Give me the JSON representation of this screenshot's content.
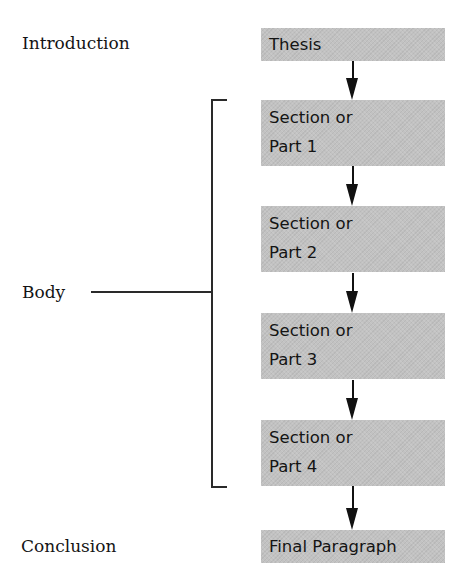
{
  "diagram": {
    "type": "flowchart",
    "left_labels": {
      "introduction": "Introduction",
      "body": "Body",
      "conclusion": "Conclusion"
    },
    "nodes": [
      {
        "id": "thesis",
        "lines": [
          "Thesis"
        ]
      },
      {
        "id": "part1",
        "lines": [
          "Section or",
          "Part 1"
        ]
      },
      {
        "id": "part2",
        "lines": [
          "Section or",
          "Part 2"
        ]
      },
      {
        "id": "part3",
        "lines": [
          "Section or",
          "Part 3"
        ]
      },
      {
        "id": "part4",
        "lines": [
          "Section or",
          "Part 4"
        ]
      },
      {
        "id": "final",
        "lines": [
          "Final Paragraph"
        ]
      }
    ],
    "edges": [
      {
        "from": "thesis",
        "to": "part1"
      },
      {
        "from": "part1",
        "to": "part2"
      },
      {
        "from": "part2",
        "to": "part3"
      },
      {
        "from": "part3",
        "to": "part4"
      },
      {
        "from": "part4",
        "to": "final"
      }
    ],
    "groups": [
      {
        "label": "Body",
        "members": [
          "part1",
          "part2",
          "part3",
          "part4"
        ]
      }
    ],
    "colors": {
      "box_fill": "#c2c2c2",
      "text": "#141414",
      "arrow": "#111111",
      "bracket": "#2a2a2a",
      "background": "#ffffff"
    }
  }
}
